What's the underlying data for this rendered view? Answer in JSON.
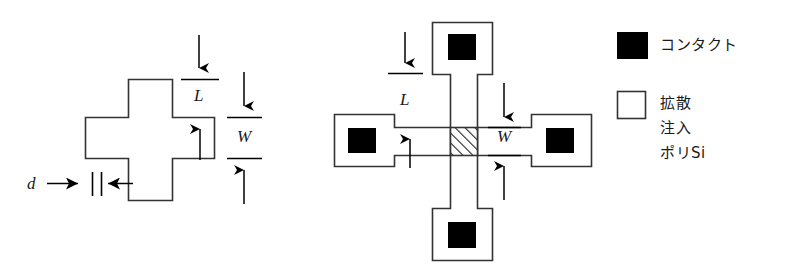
{
  "figure": {
    "stroke_color": "#333333",
    "fill_black": "#000000",
    "background": "#ffffff"
  },
  "left_diagram": {
    "name": "cross-outline-shape",
    "dimension_labels": {
      "length": "L",
      "width": "W",
      "offset": "d"
    }
  },
  "right_diagram": {
    "name": "cross-bridge-layout",
    "dimension_labels": {
      "length": "L",
      "width": "W"
    },
    "contacts_count": 4,
    "active_region": "hatched-center-square"
  },
  "legend": {
    "items": [
      {
        "swatch": "filled-black-square",
        "label": "コンタクト",
        "lines": [
          "コンタクト"
        ]
      },
      {
        "swatch": "open-white-square",
        "label": "拡散 注入 ポリSi",
        "lines": [
          "拡散",
          "注入",
          "ポリSi"
        ]
      }
    ]
  }
}
